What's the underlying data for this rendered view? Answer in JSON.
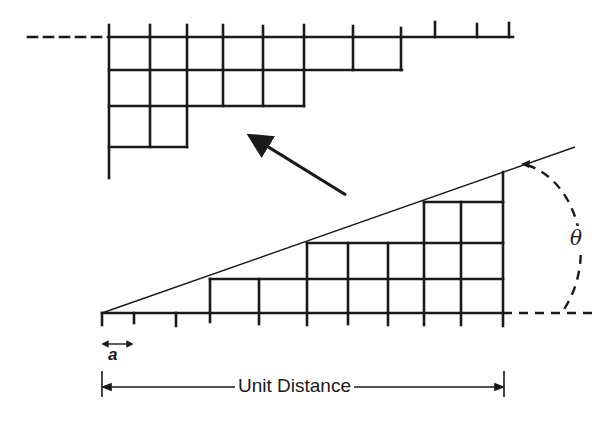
{
  "figure": {
    "labels": {
      "unit_distance": "Unit Distance",
      "step_width": "a",
      "angle": "θ"
    },
    "colors": {
      "stroke": "#1a1a1a",
      "background": "#ffffff"
    },
    "upper_grid": {
      "description": "Rotated staircase of square cells (view after rotation)",
      "rows_cell_counts": [
        8,
        6,
        3
      ]
    },
    "lower_grid": {
      "description": "Staircase of square cells under inclined line at angle theta",
      "column_heights_cells": [
        0,
        0,
        0,
        1,
        1,
        2,
        2,
        2,
        3,
        3
      ],
      "baseline_ticks": 11
    }
  }
}
